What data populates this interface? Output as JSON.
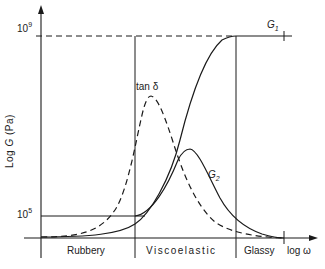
{
  "diagram": {
    "y_axis": {
      "label_prefix": "Log",
      "label_symbol": "G",
      "label_unit": "(Pa)",
      "ticks": [
        {
          "base": "10",
          "exp": "9"
        },
        {
          "base": "10",
          "exp": "5"
        }
      ]
    },
    "x_axis": {
      "label": "log ω"
    },
    "regions": [
      "Rubbery",
      "Viscoelastic",
      "Glassy"
    ],
    "curves": [
      {
        "name": "G",
        "sub": "1",
        "style": "solid",
        "description": "storage modulus, sigmoidal rise from 10^5 to 10^9"
      },
      {
        "name": "G",
        "sub": "2",
        "style": "solid",
        "description": "loss modulus, peak in viscoelastic region"
      },
      {
        "name": "tan δ",
        "style": "dashed",
        "description": "loss tangent, peak before G2 peak"
      }
    ],
    "colors": {
      "line": "#1a1a1a",
      "background": "#ffffff"
    }
  }
}
